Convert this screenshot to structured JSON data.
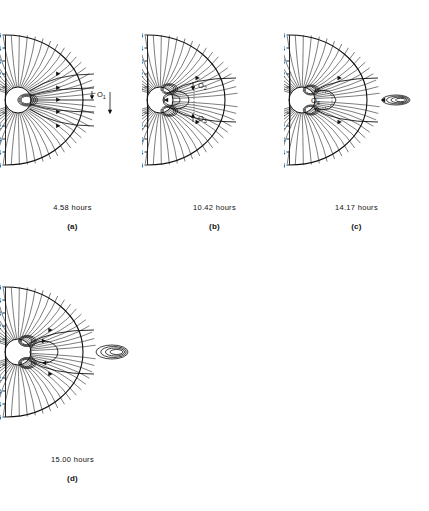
{
  "figure": {
    "type": "multi-panel-field-line-diagram",
    "panel_count": 4,
    "axis": {
      "tick_labels_upper": [
        "5",
        "4",
        "3",
        "2",
        "1"
      ],
      "tick_labels_lower": [
        "1",
        "2",
        "3",
        "4",
        "5"
      ],
      "axis_side": "left",
      "units_implied": "planetary radii"
    },
    "panels": [
      {
        "id": "a",
        "label": "(a)",
        "time": "4.58 hours",
        "annotations": [
          {
            "text": "O",
            "subscript": "1",
            "arrow": "down"
          }
        ]
      },
      {
        "id": "b",
        "label": "(b)",
        "time": "10.42 hours",
        "annotations": [
          {
            "text": "O",
            "subscript": "2",
            "arrow": "down"
          },
          {
            "text": "O",
            "subscript": "3",
            "arrow": "up"
          }
        ]
      },
      {
        "id": "c",
        "label": "(c)",
        "time": "14.17 hours",
        "annotations": [
          {
            "text": "O",
            "subscript": "4",
            "arrow": "none"
          }
        ]
      },
      {
        "id": "d",
        "label": "(d)",
        "time": "15.00 hours",
        "annotations": []
      }
    ]
  },
  "chart_data": {
    "type": "line",
    "title": "",
    "xlabel": "",
    "ylabel": "",
    "ylim": [
      -5,
      5
    ],
    "grid": false,
    "legend": "none",
    "panels": [
      {
        "name": "(a)",
        "time_hours": 4.58,
        "axis_ticks_upper": [
          5,
          4,
          3,
          2,
          1
        ],
        "axis_ticks_lower": [
          1,
          2,
          3,
          4,
          5
        ],
        "features": {
          "open_field_lines": 56,
          "closed_loops": 3,
          "neutral_points": [
            "O1"
          ],
          "plasmoid_detached": false,
          "outer_arc_radius": 5
        }
      },
      {
        "name": "(b)",
        "time_hours": 10.42,
        "axis_ticks_upper": [
          5,
          4,
          3,
          2,
          1
        ],
        "axis_ticks_lower": [
          1,
          2,
          3,
          4,
          5
        ],
        "features": {
          "open_field_lines": 56,
          "closed_loops": 5,
          "neutral_points": [
            "O2",
            "O3"
          ],
          "plasmoid_detached": false,
          "outer_arc_radius": 5
        }
      },
      {
        "name": "(c)",
        "time_hours": 14.17,
        "axis_ticks_upper": [
          5,
          4,
          3,
          2,
          1
        ],
        "axis_ticks_lower": [
          1,
          2,
          3,
          4,
          5
        ],
        "features": {
          "open_field_lines": 56,
          "closed_loops": 6,
          "neutral_points": [
            "O4"
          ],
          "plasmoid_detached": true,
          "outer_arc_radius": 5
        }
      },
      {
        "name": "(d)",
        "time_hours": 15.0,
        "axis_ticks_upper": [
          5,
          4,
          3,
          2,
          1
        ],
        "axis_ticks_lower": [
          1,
          2,
          3,
          4,
          5
        ],
        "features": {
          "open_field_lines": 56,
          "closed_loops": 6,
          "neutral_points": [],
          "plasmoid_detached": true,
          "outer_arc_radius": 5
        }
      }
    ]
  }
}
